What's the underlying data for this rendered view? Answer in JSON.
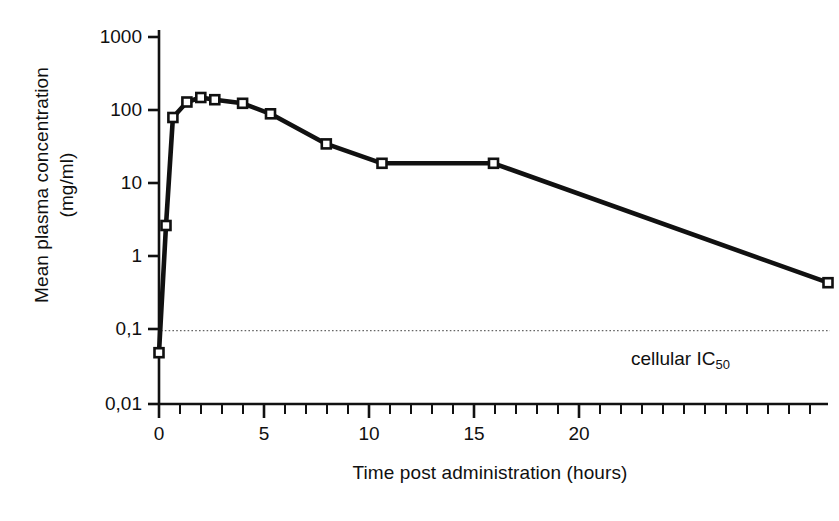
{
  "chart_data": {
    "type": "line",
    "title": "",
    "subtitle": "",
    "xlabel": "Time post administration (hours)",
    "ylabel_line1": "Mean plasma concentration",
    "ylabel_line2": "(mg/ml)",
    "yscale": "log",
    "ylim": [
      0.01,
      1000
    ],
    "xlim": [
      0,
      24
    ],
    "grid": false,
    "legend": "none",
    "x_ticks": [
      0,
      5,
      10,
      15,
      20
    ],
    "x_tick_labels": [
      "0",
      "5",
      "10",
      "15",
      "20"
    ],
    "x_minor_tick_interval": 1,
    "y_ticks": [
      1000,
      100,
      10,
      1,
      0.1,
      0.01
    ],
    "y_tick_labels": [
      "1000",
      "100",
      "10",
      "1",
      "0,1",
      "0,01"
    ],
    "series": [
      {
        "name": "Mean plasma concentration",
        "marker": "open-square",
        "x": [
          0,
          0.25,
          0.5,
          1,
          1.5,
          2,
          3,
          4,
          6,
          8,
          12,
          24
        ],
        "values": [
          0.05,
          2.7,
          80,
          130,
          150,
          140,
          125,
          90,
          35,
          19,
          19,
          0.45
        ]
      }
    ],
    "reference_lines": [
      {
        "name": "cellular-ic50",
        "label": "cellular IC",
        "label_subscript": "50",
        "y": 0.1,
        "style": "dotted",
        "orientation": "horizontal"
      }
    ],
    "colors": {
      "line": "#111111",
      "marker_fill": "#ffffff",
      "marker_edge": "#111111",
      "axis": "#111111",
      "reference_line": "#555555",
      "background": "#ffffff"
    }
  }
}
